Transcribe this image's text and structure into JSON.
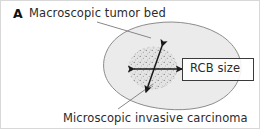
{
  "figure": {
    "panel_label": "A",
    "width": 260,
    "height": 129,
    "background_color": "#ffffff",
    "border_color": "#d8d8d8"
  },
  "annotations": {
    "macroscopic_label": "Macroscopic tumor bed",
    "microscopic_label": "Microscopic invasive carcinoma",
    "rcb_size_label": "RCB size"
  },
  "shapes": {
    "tumor_bed": {
      "name": "macroscopic-tumor-bed",
      "fill_color": "#ebebeb",
      "stroke_color": "#8c8c8c"
    },
    "carcinoma_region": {
      "name": "microscopic-invasive-carcinoma",
      "fill_color": "#e2e2e2",
      "stipple_color": "#6e6e6e"
    },
    "measure_arrows": {
      "name": "rcb-size-measurement-arrows",
      "stroke_color": "#1a1a1a",
      "horizontal_arrow": "bidirectional",
      "diagonal_arrow": "bidirectional"
    },
    "leader_lines": {
      "stroke_color": "#7a7a7a"
    },
    "rcb_box": {
      "border_color": "#3a3a3a",
      "fill_color": "#ffffff"
    }
  }
}
